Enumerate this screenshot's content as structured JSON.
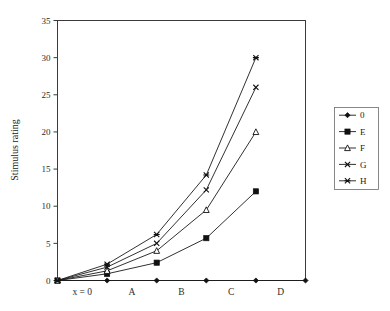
{
  "chart_data": {
    "type": "line",
    "title": "",
    "subtitle": "",
    "xlabel": "",
    "ylabel": "Stimulus rating",
    "ylim": [
      0,
      35
    ],
    "ytick_values": [
      0,
      5,
      10,
      15,
      20,
      25,
      30,
      35
    ],
    "ytick_labels": [
      "0",
      "5",
      "10",
      "15",
      "20",
      "25",
      "30",
      "35"
    ],
    "grid": false,
    "legend_position": "right-outside",
    "x_index": [
      0,
      1,
      2,
      3,
      4,
      5
    ],
    "xtick_labels": [
      "x = 0",
      "A",
      "B",
      "C",
      "D"
    ],
    "x_category_labels": [
      "x = 0",
      "A",
      "B",
      "C",
      "D"
    ],
    "series": [
      {
        "name": "0",
        "marker": "filled-diamond",
        "values": [
          0,
          0,
          0,
          0,
          0,
          0
        ]
      },
      {
        "name": "E",
        "marker": "filled-square",
        "values": [
          0,
          0.9,
          2.4,
          5.7,
          12,
          null
        ]
      },
      {
        "name": "F",
        "marker": "open-triangle",
        "values": [
          0,
          1.3,
          4.0,
          9.5,
          20,
          null
        ]
      },
      {
        "name": "G",
        "marker": "cross-x",
        "values": [
          0,
          1.8,
          5.0,
          12.2,
          26,
          null
        ]
      },
      {
        "name": "H",
        "marker": "asterisk",
        "values": [
          0,
          2.2,
          6.2,
          14.2,
          30,
          null
        ]
      }
    ],
    "colors": {
      "line": "#1a1a1a",
      "axis": "#3a3a3a",
      "text": "#1a1a1a",
      "background": "#ffffff"
    }
  },
  "legend": {
    "entries": [
      {
        "label": "0"
      },
      {
        "label": "E"
      },
      {
        "label": "F"
      },
      {
        "label": "G"
      },
      {
        "label": "H"
      }
    ]
  },
  "axes": {
    "y_title": "Stimulus rating"
  }
}
